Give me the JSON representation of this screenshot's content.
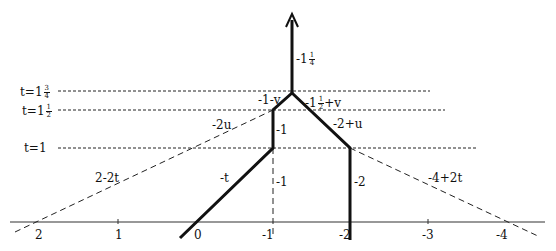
{
  "diagram": {
    "title": "",
    "time_levels": [
      {
        "id": "t1_75",
        "prefix": "t=1",
        "num": "3",
        "den": "4",
        "y": 91,
        "x_end": 430
      },
      {
        "id": "t1_5",
        "prefix": "t=1",
        "num": "1",
        "den": "2",
        "y": 110,
        "x_end": 445
      },
      {
        "id": "t1",
        "prefix": "t=1",
        "num": "",
        "den": "",
        "y": 148,
        "x_end": 478
      }
    ],
    "axis": {
      "y": 222,
      "x_start": 10,
      "x_end": 545,
      "ticks": [
        {
          "label": "2",
          "x": 38
        },
        {
          "label": "1",
          "x": 118
        },
        {
          "label": "0",
          "x": 197
        },
        {
          "label": "-1",
          "x": 273
        },
        {
          "label": "-2",
          "x": 350
        },
        {
          "label": "-3",
          "x": 428
        },
        {
          "label": "-4",
          "x": 505
        }
      ]
    },
    "segment_labels": {
      "top_arrow": {
        "prefix": "-1",
        "num": "1",
        "den": "4"
      },
      "left_upper": "-1-v",
      "right_upper": {
        "prefix": "-1",
        "num": "1",
        "den": "2",
        "suffix": "+v"
      },
      "left_dashed_upper": "-2u",
      "middle_vertical": "-1",
      "right_diag": "-2+u",
      "left_dashed_lower": "2-2t",
      "left_solid_diag": "-t",
      "dashed_vertical": "-1",
      "right_vertical": "-2",
      "right_dashed": "-4+2t"
    },
    "colors": {
      "ink": "#111111",
      "background": "#ffffff"
    }
  }
}
